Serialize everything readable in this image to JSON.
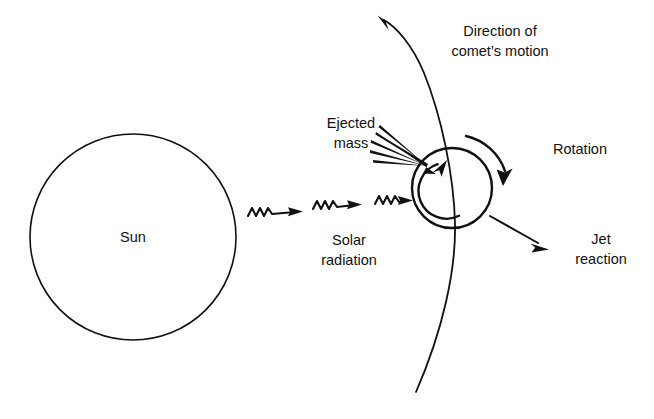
{
  "figure": {
    "kind": "schematic-diagram",
    "background_color": "#ffffff",
    "ink_color": "#111111"
  },
  "labels": {
    "sun": {
      "text": "Sun",
      "lines": [
        "Sun"
      ],
      "x": 133,
      "y": 237,
      "anchor": "middle"
    },
    "solar_radiation": {
      "text": "Solar radiation",
      "lines": [
        "Solar",
        "radiation"
      ],
      "x": 349,
      "y": 240,
      "anchor": "middle"
    },
    "ejected_mass": {
      "text": "Ejected mass",
      "lines": [
        "Ejected",
        "mass"
      ],
      "x": 351,
      "y": 128,
      "anchor": "middle"
    },
    "direction_of_motion": {
      "text": "Direction of comet's motion",
      "lines": [
        "Direction of",
        "comet’s motion"
      ],
      "x": 500,
      "y": 38,
      "anchor": "middle"
    },
    "rotation": {
      "text": "Rotation",
      "lines": [
        "Rotation"
      ],
      "x": 580,
      "y": 150,
      "anchor": "middle"
    },
    "jet_reaction": {
      "text": "Jet reaction",
      "lines": [
        "Jet",
        "reaction"
      ],
      "x": 601,
      "y": 246,
      "anchor": "middle"
    }
  },
  "geometry": {
    "sun_circle": {
      "cx": 133,
      "cy": 237,
      "r": 103,
      "stroke_width": 1.6
    },
    "nucleus_circle": {
      "cx": 452,
      "cy": 188,
      "r": 40,
      "stroke_width": 2.2
    },
    "inner_rotation_arc": {
      "cx": 452,
      "cy": 188,
      "r": 28,
      "direction": "counterclockwise"
    },
    "outer_rotation_arc": {
      "cx": 452,
      "cy": 188,
      "r": 54,
      "direction": "clockwise"
    },
    "orbit_curve": {
      "description": "comet trajectory arc bowing right, arrowhead at top-left",
      "arrow_tip": {
        "x": 378,
        "y": 22
      },
      "bottom_end": {
        "x": 416,
        "y": 392
      }
    },
    "solar_radiation_arrows": [
      {
        "x": 248,
        "y": 212,
        "length": 55
      },
      {
        "x": 313,
        "y": 205,
        "length": 55
      },
      {
        "x": 375,
        "y": 200,
        "length": 50
      }
    ],
    "ejected_mass_fan": {
      "apex": {
        "x": 427,
        "y": 166
      },
      "ray_count": 5,
      "arrow_tip": {
        "x": 427,
        "y": 166
      },
      "arrow_tail": {
        "x": 382,
        "y": 140
      }
    },
    "jet_arrow": {
      "tail": {
        "x": 492,
        "y": 217
      },
      "tip": {
        "x": 547,
        "y": 249
      }
    }
  },
  "elements": [
    {
      "name": "sun",
      "label": "Sun"
    },
    {
      "name": "comet-nucleus",
      "label": ""
    },
    {
      "name": "solar-radiation-arrows",
      "label": "Solar radiation"
    },
    {
      "name": "ejected-mass-fan",
      "label": "Ejected mass"
    },
    {
      "name": "orbit-trajectory",
      "label": "Direction of comet's motion"
    },
    {
      "name": "rotation-arrow",
      "label": "Rotation"
    },
    {
      "name": "jet-reaction-arrow",
      "label": "Jet reaction"
    }
  ]
}
